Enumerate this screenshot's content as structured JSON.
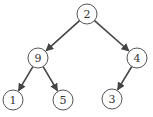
{
  "tree": {
    "nodes": [
      {
        "id": "n2",
        "label": "2",
        "x": 87,
        "y": 14
      },
      {
        "id": "n9",
        "label": "9",
        "x": 38,
        "y": 58
      },
      {
        "id": "n4",
        "label": "4",
        "x": 137,
        "y": 58
      },
      {
        "id": "n1",
        "label": "1",
        "x": 13,
        "y": 100
      },
      {
        "id": "n5",
        "label": "5",
        "x": 63,
        "y": 100
      },
      {
        "id": "n3",
        "label": "3",
        "x": 112,
        "y": 99
      }
    ],
    "edges": [
      {
        "from": "n2",
        "to": "n9"
      },
      {
        "from": "n2",
        "to": "n4"
      },
      {
        "from": "n9",
        "to": "n1"
      },
      {
        "from": "n9",
        "to": "n5"
      },
      {
        "from": "n4",
        "to": "n3"
      }
    ],
    "colors": {
      "edge": "#444444",
      "node_stroke": "#555555",
      "node_fill": "#ffffff"
    }
  }
}
